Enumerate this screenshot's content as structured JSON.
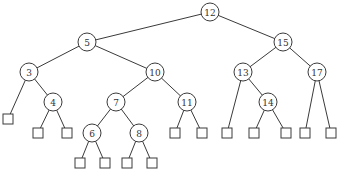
{
  "diagram": {
    "type": "binary-search-tree",
    "root": "12",
    "nodes": [
      {
        "id": "12",
        "label": "12",
        "kind": "internal",
        "left": "5",
        "right": "15"
      },
      {
        "id": "5",
        "label": "5",
        "kind": "internal",
        "left": "3",
        "right": "10"
      },
      {
        "id": "15",
        "label": "15",
        "kind": "internal",
        "left": "13",
        "right": "17"
      },
      {
        "id": "3",
        "label": "3",
        "kind": "internal",
        "left": "L1",
        "right": "4"
      },
      {
        "id": "10",
        "label": "10",
        "kind": "internal",
        "left": "7",
        "right": "11"
      },
      {
        "id": "13",
        "label": "13",
        "kind": "internal",
        "left": "L10",
        "right": "14"
      },
      {
        "id": "17",
        "label": "17",
        "kind": "internal",
        "left": "L13",
        "right": "L14"
      },
      {
        "id": "4",
        "label": "4",
        "kind": "internal",
        "left": "L2",
        "right": "L3"
      },
      {
        "id": "7",
        "label": "7",
        "kind": "internal",
        "left": "6",
        "right": "8"
      },
      {
        "id": "11",
        "label": "11",
        "kind": "internal",
        "left": "L8",
        "right": "L9"
      },
      {
        "id": "14",
        "label": "14",
        "kind": "internal",
        "left": "L11",
        "right": "L12"
      },
      {
        "id": "6",
        "label": "6",
        "kind": "internal",
        "left": "L4",
        "right": "L5"
      },
      {
        "id": "8",
        "label": "8",
        "kind": "internal",
        "left": "L6",
        "right": "L7"
      },
      {
        "id": "L1",
        "label": "",
        "kind": "leaf"
      },
      {
        "id": "L2",
        "label": "",
        "kind": "leaf"
      },
      {
        "id": "L3",
        "label": "",
        "kind": "leaf"
      },
      {
        "id": "L4",
        "label": "",
        "kind": "leaf"
      },
      {
        "id": "L5",
        "label": "",
        "kind": "leaf"
      },
      {
        "id": "L6",
        "label": "",
        "kind": "leaf"
      },
      {
        "id": "L7",
        "label": "",
        "kind": "leaf"
      },
      {
        "id": "L8",
        "label": "",
        "kind": "leaf"
      },
      {
        "id": "L9",
        "label": "",
        "kind": "leaf"
      },
      {
        "id": "L10",
        "label": "",
        "kind": "leaf"
      },
      {
        "id": "L11",
        "label": "",
        "kind": "leaf"
      },
      {
        "id": "L12",
        "label": "",
        "kind": "leaf"
      },
      {
        "id": "L13",
        "label": "",
        "kind": "leaf"
      },
      {
        "id": "L14",
        "label": "",
        "kind": "leaf"
      }
    ]
  }
}
